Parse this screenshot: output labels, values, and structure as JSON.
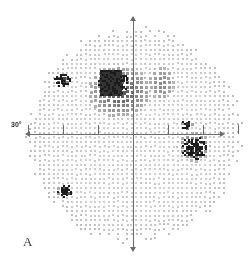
{
  "figure": {
    "panel_label": "A",
    "type": "visual-field-grayscale-plot",
    "degree_label": "30°"
  },
  "axes": {
    "horizontal": {
      "name": "horizontal-meridian",
      "y_px": 134,
      "x_start_px": 29,
      "x_end_px": 221
    },
    "vertical": {
      "name": "vertical-meridian",
      "x_px": 133,
      "y_start_px": 20,
      "y_end_px": 248
    },
    "tick_offsets_px": [
      -105,
      -70,
      -35,
      35,
      70,
      105
    ],
    "tick_color": "#6a6a6a"
  },
  "colors": {
    "background": "#ffffff",
    "axis": "#6a6a6a",
    "dot_light": "#c8c8c8",
    "dot_mid": "#8f8f8f",
    "dot_dark": "#4a4a4a",
    "dot_black": "#1c1c1c",
    "label": "#3a3a3a"
  },
  "chart_data": {
    "type": "heatmap",
    "title": "",
    "subtitle": "",
    "xlabel": "",
    "ylabel": "",
    "grid": false,
    "legend": "none",
    "field": {
      "center_x_px": 133,
      "center_y_px": 134,
      "radius_px": 108,
      "dot_spacing_px": 4.6,
      "dot_size_px": 2.2
    },
    "severity_levels": [
      {
        "level": 0,
        "label": "normal",
        "gray": "#cfcfcf"
      },
      {
        "level": 1,
        "label": "mild",
        "gray": "#aaaaaa"
      },
      {
        "level": 2,
        "label": "moderate",
        "gray": "#878787"
      },
      {
        "level": 3,
        "label": "severe",
        "gray": "#565656"
      },
      {
        "level": 4,
        "label": "absolute",
        "gray": "#1c1c1c"
      }
    ],
    "defects": [
      {
        "name": "superior-arcuate-scotoma",
        "cx": 118,
        "cy": 90,
        "rx": 36,
        "ry": 30,
        "severity": 3
      },
      {
        "name": "superior-dense-core",
        "cx": 112,
        "cy": 82,
        "rx": 16,
        "ry": 13,
        "severity": 4
      },
      {
        "name": "superior-nasal-step",
        "cx": 160,
        "cy": 82,
        "rx": 16,
        "ry": 20,
        "severity": 2
      },
      {
        "name": "blind-spot",
        "cx": 193,
        "cy": 147,
        "rx": 13,
        "ry": 12,
        "severity": 4
      },
      {
        "name": "blind-spot-halo",
        "cx": 193,
        "cy": 145,
        "rx": 18,
        "ry": 17,
        "severity": 3
      },
      {
        "name": "superior-temporal-island",
        "cx": 61,
        "cy": 79,
        "rx": 9,
        "ry": 7,
        "severity": 4
      },
      {
        "name": "inferior-temporal-island",
        "cx": 63,
        "cy": 190,
        "rx": 8,
        "ry": 7,
        "severity": 4
      },
      {
        "name": "superior-paracentral-spot",
        "cx": 186,
        "cy": 124,
        "rx": 6,
        "ry": 5,
        "severity": 4
      },
      {
        "name": "peripheral-falloff-ring",
        "cx": 133,
        "cy": 134,
        "rx": 104,
        "ry": 104,
        "severity": 1
      }
    ]
  }
}
